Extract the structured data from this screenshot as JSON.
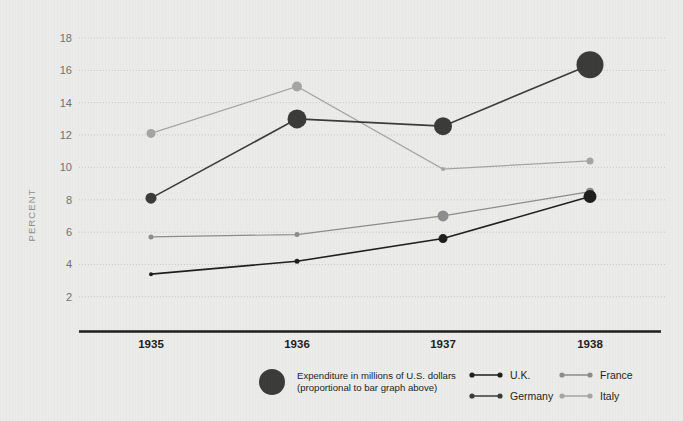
{
  "chart_data": {
    "type": "line",
    "title": "",
    "xlabel": "",
    "ylabel": "PERCENT",
    "categories": [
      "1935",
      "1936",
      "1937",
      "1938"
    ],
    "ylim": [
      0,
      19
    ],
    "yticks": [
      2,
      4,
      6,
      8,
      10,
      12,
      14,
      16,
      18
    ],
    "grid": true,
    "legend_position": "bottom",
    "series": [
      {
        "name": "U.K.",
        "color": "#1d1d1b",
        "values": [
          3.4,
          4.2,
          5.6,
          8.2
        ],
        "marker_sizes": [
          4,
          5,
          9,
          13
        ]
      },
      {
        "name": "Germany",
        "color": "#3a3a38",
        "values": [
          8.1,
          13.0,
          12.55,
          16.35
        ],
        "marker_sizes": [
          11,
          19,
          18,
          27
        ]
      },
      {
        "name": "France",
        "color": "#8c8d8c",
        "values": [
          5.7,
          5.85,
          7.0,
          8.5
        ],
        "marker_sizes": [
          5,
          5,
          11,
          8
        ]
      },
      {
        "name": "Italy",
        "color": "#a5a6a4",
        "values": [
          12.1,
          15.0,
          9.9,
          10.4
        ],
        "marker_sizes": [
          9,
          10,
          4,
          7
        ]
      }
    ],
    "annotations": [
      "Expenditure in millions of U.S. dollars",
      "(proportional to bar graph above)"
    ]
  },
  "legend": {
    "note_line1": "Expenditure in millions of U.S. dollars",
    "note_line2": "(proportional to bar graph above)",
    "entries": [
      {
        "label": "U.K."
      },
      {
        "label": "Germany"
      },
      {
        "label": "France"
      },
      {
        "label": "Italy"
      }
    ]
  },
  "axes": {
    "y_title": "PERCENT",
    "y_ticks": [
      "18",
      "16",
      "14",
      "12",
      "10",
      "8",
      "6",
      "4",
      "2"
    ],
    "x_ticks": [
      "1935",
      "1936",
      "1937",
      "1938"
    ]
  },
  "colors": {
    "background": "#ececeb",
    "axis_line": "#1d1d1b",
    "gridline": "#c9cac8",
    "uk": "#1d1d1b",
    "germany": "#3a3a38",
    "france": "#8c8d8c",
    "italy": "#a5a6a4",
    "tick_label": "#6f7070",
    "x_label": "#1d1d1b"
  }
}
